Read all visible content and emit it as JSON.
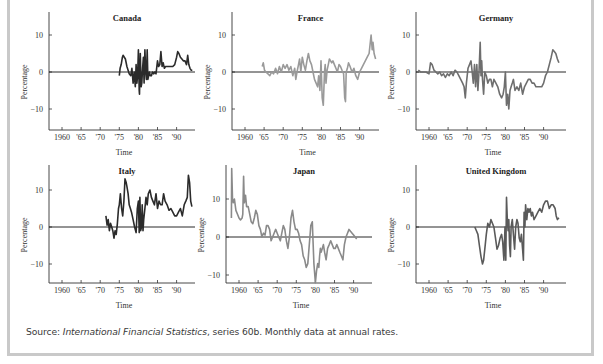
{
  "figure": {
    "source_prefix": "Source: ",
    "source_title": "International Financial Statistics",
    "source_suffix": ", series 60b. Monthly data at annual rates."
  },
  "chart_data": [
    {
      "type": "line",
      "title": "Canada",
      "xlabel": "Time",
      "ylabel": "Percentage",
      "x_ticks": [
        "1960",
        "'65",
        "'70",
        "'75",
        "'80",
        "'85",
        "'90"
      ],
      "y_ticks": [
        10,
        0,
        -10
      ],
      "xlim": [
        1958,
        1994.5
      ],
      "ylim": [
        -15,
        15
      ],
      "color": "#2b2b2b",
      "series": [
        {
          "name": "Canada",
          "x": [
            1975.0,
            1975.2,
            1975.5,
            1975.8,
            1976.0,
            1976.3,
            1976.6,
            1977.0,
            1977.3,
            1977.6,
            1978.0,
            1978.3,
            1978.6,
            1978.9,
            1979.2,
            1979.4,
            1979.6,
            1979.8,
            1980.0,
            1980.2,
            1980.3,
            1980.5,
            1980.7,
            1980.9,
            1981.1,
            1981.3,
            1981.5,
            1981.7,
            1981.9,
            1982.1,
            1982.3,
            1982.5,
            1982.7,
            1982.9,
            1983.1,
            1983.4,
            1983.7,
            1984.0,
            1984.3,
            1984.6,
            1985.0,
            1985.3,
            1985.6,
            1985.9,
            1986.2,
            1986.5,
            1986.8,
            1987.1,
            1987.5,
            1988.0,
            1988.5,
            1989.0,
            1989.5,
            1990.0,
            1990.3,
            1990.6,
            1991.0,
            1991.4,
            1991.8,
            1992.2,
            1992.6,
            1992.9,
            1993.2,
            1993.5,
            1993.8,
            1994.1
          ],
          "y": [
            -1,
            1,
            2,
            4,
            4.5,
            4,
            3.5,
            1.5,
            0.5,
            -0.5,
            -1,
            1,
            -3,
            0,
            -4,
            2,
            -3,
            -1,
            6,
            -5,
            -6,
            5,
            -4,
            -3,
            1,
            4,
            -3,
            6,
            0,
            -2,
            6,
            -2,
            -1,
            0,
            -1,
            -1,
            0,
            -0.5,
            0,
            -0.5,
            3,
            1.5,
            2,
            5.5,
            1.5,
            2.5,
            1,
            1.5,
            1.5,
            1.5,
            1.5,
            1.5,
            2,
            4,
            5.5,
            5,
            4,
            3.5,
            3,
            3,
            2,
            4.5,
            2,
            1,
            0.5,
            0.5
          ]
        }
      ]
    },
    {
      "type": "line",
      "title": "France",
      "xlabel": "Time",
      "ylabel": "Percentage",
      "x_ticks": [
        "1960",
        "'65",
        "'70",
        "'75",
        "'80",
        "'85",
        "'90"
      ],
      "y_ticks": [
        10,
        0,
        -10
      ],
      "xlim": [
        1957.5,
        1994.5
      ],
      "ylim": [
        -15,
        15
      ],
      "color": "#9a9a9a",
      "series": [
        {
          "name": "France",
          "x": [
            1964.5,
            1964.8,
            1965.1,
            1965.5,
            1966.0,
            1966.5,
            1967.0,
            1967.5,
            1968.0,
            1968.5,
            1969.0,
            1969.5,
            1970.0,
            1970.5,
            1971.0,
            1971.5,
            1972.0,
            1972.5,
            1973.0,
            1973.3,
            1973.6,
            1974.0,
            1974.3,
            1974.6,
            1975.0,
            1975.4,
            1975.8,
            1976.2,
            1976.6,
            1977.0,
            1977.4,
            1977.8,
            1978.2,
            1978.6,
            1979.0,
            1979.3,
            1979.6,
            1979.9,
            1980.2,
            1980.5,
            1980.8,
            1981.0,
            1981.2,
            1981.5,
            1981.8,
            1982.1,
            1982.4,
            1982.7,
            1983.0,
            1983.4,
            1983.8,
            1984.2,
            1984.6,
            1985.0,
            1985.4,
            1985.8,
            1986.1,
            1986.3,
            1986.5,
            1986.8,
            1987.1,
            1987.5,
            1988.0,
            1988.5,
            1989.0,
            1989.5,
            1990.0,
            1990.5,
            1991.0,
            1991.5,
            1992.0,
            1992.5,
            1993.0,
            1993.3,
            1993.5,
            1993.8,
            1994.2
          ],
          "y": [
            1.5,
            2.5,
            0.5,
            0,
            -0.5,
            -1,
            0,
            -0.5,
            1,
            -0.5,
            1.5,
            0,
            2,
            1,
            2,
            0.5,
            1.5,
            -1,
            1,
            -2,
            0,
            2,
            3.5,
            0,
            4,
            2,
            0.5,
            3,
            5,
            3,
            2,
            0,
            -2,
            -3,
            -4,
            -1,
            -5,
            3,
            -7,
            -9,
            0,
            2,
            -3,
            0.5,
            2,
            3.5,
            3,
            2.5,
            3,
            2,
            1,
            0,
            2,
            1.5,
            0.5,
            -0.5,
            -7,
            -8,
            0,
            1,
            2.5,
            1.5,
            0,
            1,
            -1,
            -2,
            0,
            1,
            2,
            3,
            4,
            5,
            10,
            6,
            8,
            5,
            3.5
          ]
        }
      ]
    },
    {
      "type": "line",
      "title": "Germany",
      "xlabel": "Time",
      "ylabel": "Percentage",
      "x_ticks": [
        "1960",
        "'65",
        "'70",
        "'75",
        "'80",
        "'85",
        "'90"
      ],
      "y_ticks": [
        10,
        0,
        -10
      ],
      "xlim": [
        1957.0,
        1994.5
      ],
      "ylim": [
        -15,
        15
      ],
      "color": "#6e6e6e",
      "series": [
        {
          "name": "Germany",
          "x": [
            1957.2,
            1957.8,
            1958.5,
            1959.2,
            1960.0,
            1960.4,
            1960.8,
            1961.3,
            1961.8,
            1962.3,
            1962.8,
            1963.3,
            1963.8,
            1964.3,
            1964.8,
            1965.3,
            1965.8,
            1966.3,
            1966.8,
            1967.3,
            1967.8,
            1968.3,
            1968.8,
            1969.2,
            1969.5,
            1969.8,
            1970.2,
            1970.6,
            1971.0,
            1971.3,
            1971.6,
            1971.9,
            1972.2,
            1972.5,
            1972.8,
            1973.1,
            1973.4,
            1973.6,
            1973.8,
            1974.0,
            1974.3,
            1974.6,
            1975.0,
            1975.4,
            1975.8,
            1976.2,
            1976.6,
            1977.0,
            1977.5,
            1978.0,
            1978.5,
            1979.0,
            1979.4,
            1979.7,
            1980.0,
            1980.3,
            1980.6,
            1980.9,
            1981.2,
            1981.5,
            1981.8,
            1982.1,
            1982.5,
            1983.0,
            1983.5,
            1984.0,
            1984.5,
            1985.0,
            1985.5,
            1986.0,
            1986.5,
            1987.0,
            1987.5,
            1988.0,
            1988.5,
            1989.0,
            1989.5,
            1990.0,
            1990.5,
            1991.0,
            1991.5,
            1992.0,
            1992.4,
            1992.8,
            1993.2,
            1993.6,
            1994.0
          ],
          "y": [
            0.5,
            0,
            0,
            0,
            -0.5,
            2.5,
            2,
            0.5,
            0,
            -0.5,
            0,
            -1,
            -0.5,
            -1.5,
            -0.5,
            -1,
            0,
            -1,
            0.5,
            0,
            -1,
            -2,
            -3,
            -4,
            -7,
            -3,
            1,
            2,
            3,
            0,
            -3,
            2,
            -4,
            2,
            -5,
            0,
            8,
            -1,
            3,
            -2,
            -6,
            0,
            -1,
            -3,
            -2,
            -2,
            -4,
            -2,
            -3,
            -4,
            -6,
            -7,
            -6,
            -4,
            0,
            -9,
            -6,
            -10,
            -5,
            -4,
            -3,
            -2,
            -5,
            -4,
            -5,
            -3,
            -6,
            -4,
            -3,
            -2,
            -2,
            -3,
            -3,
            -4,
            -4,
            -4,
            -4,
            -3,
            -1,
            0,
            2,
            4,
            6,
            5.5,
            5,
            3.5,
            2.5
          ]
        }
      ]
    },
    {
      "type": "line",
      "title": "Italy",
      "xlabel": "Time",
      "ylabel": "Percentage",
      "x_ticks": [
        "1960",
        "'65",
        "'70",
        "'75",
        "'80",
        "'85",
        "'90"
      ],
      "y_ticks": [
        10,
        0,
        -10
      ],
      "xlim": [
        1958,
        1994.5
      ],
      "ylim": [
        -15,
        15
      ],
      "color": "#2b2b2b",
      "series": [
        {
          "name": "Italy",
          "x": [
            1971.5,
            1971.8,
            1972.1,
            1972.4,
            1972.7,
            1973.0,
            1973.3,
            1973.6,
            1973.9,
            1974.2,
            1974.5,
            1974.8,
            1975.0,
            1975.3,
            1975.6,
            1975.9,
            1976.2,
            1976.5,
            1976.8,
            1977.0,
            1977.3,
            1977.6,
            1977.9,
            1978.2,
            1978.6,
            1979.0,
            1979.4,
            1979.7,
            1980.0,
            1980.2,
            1980.4,
            1980.6,
            1980.8,
            1981.0,
            1981.2,
            1981.4,
            1981.7,
            1982.0,
            1982.3,
            1982.6,
            1983.0,
            1983.4,
            1983.8,
            1984.2,
            1984.6,
            1985.0,
            1985.4,
            1985.8,
            1986.2,
            1986.6,
            1987.0,
            1987.5,
            1988.0,
            1988.5,
            1989.0,
            1989.5,
            1990.0,
            1990.5,
            1991.0,
            1991.5,
            1992.0,
            1992.4,
            1992.8,
            1993.1,
            1993.4,
            1993.7,
            1994.0
          ],
          "y": [
            3,
            0.5,
            2,
            -1,
            1,
            0,
            -1,
            -3,
            -1,
            -2,
            1,
            5,
            6,
            9,
            5,
            3,
            7,
            13,
            12,
            11,
            9,
            6,
            5,
            4,
            2,
            0,
            -1.5,
            5,
            7,
            -1.5,
            8,
            -1,
            0,
            6,
            -1,
            2,
            5,
            8,
            6,
            9,
            10,
            8,
            7,
            6,
            9,
            5,
            7,
            6,
            6,
            9,
            7,
            6,
            4.5,
            5,
            4,
            3,
            3,
            4,
            5,
            3,
            6,
            7,
            8,
            14,
            12,
            7,
            5.5
          ]
        }
      ]
    },
    {
      "type": "line",
      "title": "Japan",
      "xlabel": "Time",
      "ylabel": "Percentage",
      "x_ticks": [
        "1960",
        "'65",
        "'70",
        "'75",
        "'80",
        "'85",
        "'90"
      ],
      "y_ticks": [
        10,
        0,
        -10
      ],
      "xlim": [
        1957.8,
        1994.5
      ],
      "ylim": [
        -12,
        18
      ],
      "color": "#8a8a8a",
      "series": [
        {
          "name": "Japan",
          "x": [
            1958.0,
            1958.1,
            1958.3,
            1958.5,
            1958.8,
            1959.2,
            1959.6,
            1960.0,
            1960.4,
            1960.8,
            1961.0,
            1961.2,
            1961.4,
            1961.7,
            1962.0,
            1962.4,
            1962.8,
            1963.2,
            1963.6,
            1964.0,
            1964.4,
            1964.8,
            1965.2,
            1965.6,
            1966.0,
            1966.4,
            1966.8,
            1967.2,
            1967.6,
            1968.0,
            1968.4,
            1968.8,
            1969.2,
            1969.6,
            1970.0,
            1970.4,
            1970.8,
            1971.2,
            1971.6,
            1972.0,
            1972.4,
            1972.8,
            1973.2,
            1973.6,
            1974.0,
            1974.4,
            1974.8,
            1975.2,
            1975.6,
            1976.0,
            1976.4,
            1976.8,
            1977.2,
            1977.6,
            1978.0,
            1978.4,
            1978.8,
            1979.2,
            1979.6,
            1980.0,
            1980.3,
            1980.6,
            1980.9,
            1981.1,
            1981.3,
            1981.5,
            1981.8,
            1982.1,
            1982.4,
            1982.8,
            1983.2,
            1983.6,
            1984.0,
            1984.4,
            1984.8,
            1985.2,
            1985.6,
            1986.0,
            1986.4,
            1986.8,
            1987.2,
            1987.6,
            1988.0,
            1988.4,
            1988.8,
            1989.2,
            1989.6,
            1990.0,
            1990.4,
            1990.8,
            1991.2,
            1991.6,
            1992.0,
            1992.4,
            1992.8,
            1993.2,
            1993.6,
            1994.0
          ],
          "y": [
            5,
            18,
            10,
            9,
            10,
            7,
            6,
            5,
            4.5,
            5,
            6,
            16,
            9,
            11,
            8,
            8,
            6,
            4,
            3.5,
            5,
            7,
            6,
            3,
            2,
            0,
            1,
            0.5,
            3,
            3,
            2,
            -1,
            0,
            1,
            2,
            1,
            0,
            -1,
            1,
            3,
            2,
            -1,
            -3,
            0,
            5,
            7,
            4,
            2,
            2,
            1,
            -1,
            -2,
            -5,
            -6,
            -8,
            -7,
            -2,
            3,
            4,
            -7,
            -12,
            -9,
            -7,
            -8,
            -5,
            -3,
            -4,
            -3,
            -2,
            -4,
            -6,
            -3,
            -2,
            -1,
            -2,
            -3,
            -3,
            -2,
            -3,
            -4,
            -5,
            -6,
            -2,
            0,
            1,
            2,
            1.5,
            1,
            0.5,
            0,
            -0.5
          ]
        }
      ]
    },
    {
      "type": "line",
      "title": "United Kingdom",
      "xlabel": "Time",
      "ylabel": "Percentage",
      "x_ticks": [
        "1960",
        "'65",
        "'70",
        "'75",
        "'80",
        "'85",
        "'90"
      ],
      "y_ticks": [
        10,
        0,
        -10
      ],
      "xlim": [
        1957.0,
        1994.5
      ],
      "ylim": [
        -15,
        15
      ],
      "color": "#5a5a5a",
      "series": [
        {
          "name": "United Kingdom",
          "x": [
            1972.0,
            1972.4,
            1972.8,
            1973.2,
            1973.6,
            1974.0,
            1974.3,
            1974.6,
            1975.0,
            1975.4,
            1975.8,
            1976.2,
            1976.6,
            1977.0,
            1977.4,
            1977.8,
            1978.2,
            1978.6,
            1979.0,
            1979.3,
            1979.6,
            1979.9,
            1980.1,
            1980.3,
            1980.5,
            1980.7,
            1980.9,
            1981.1,
            1981.3,
            1981.5,
            1981.8,
            1982.1,
            1982.4,
            1982.7,
            1983.0,
            1983.3,
            1983.6,
            1983.9,
            1984.2,
            1984.5,
            1984.7,
            1984.9,
            1985.1,
            1985.3,
            1985.6,
            1985.9,
            1986.2,
            1986.5,
            1986.8,
            1987.1,
            1987.5,
            1988.0,
            1988.5,
            1989.0,
            1989.5,
            1990.0,
            1990.5,
            1991.0,
            1991.5,
            1992.0,
            1992.5,
            1993.0,
            1993.3,
            1993.6,
            1994.0
          ],
          "y": [
            0,
            -1,
            -2,
            -5,
            -8,
            -10,
            -9,
            -6,
            -2,
            1,
            0,
            2,
            1,
            0,
            -3,
            -6,
            -5,
            -3,
            -2,
            -4,
            -9,
            0,
            -9,
            8,
            2,
            -1,
            2,
            -5,
            -8,
            0,
            2,
            -2,
            -6,
            0,
            2,
            1,
            -3,
            -4,
            -2,
            -6,
            -9,
            4,
            0,
            6,
            2,
            5,
            4,
            5,
            3,
            4,
            2,
            3,
            4,
            5,
            4,
            6,
            7,
            7,
            5,
            6,
            6,
            5,
            3,
            2,
            2.5
          ]
        }
      ]
    }
  ]
}
